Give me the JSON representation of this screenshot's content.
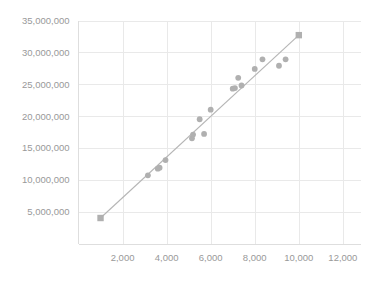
{
  "chart_data": {
    "type": "scatter",
    "title": "",
    "subtitle": "",
    "xlabel": "",
    "ylabel": "",
    "xlim": [
      0,
      12800
    ],
    "ylim": [
      0,
      35000000
    ],
    "grid": true,
    "legend": false,
    "legend_position": "none",
    "colors": {
      "marker": "#b0b0b0",
      "trendline": "#b5b5b5",
      "gridline": "#e9e9e9",
      "axis": "#dedede",
      "tick_label": "#999999",
      "background": "#ffffff"
    },
    "x_ticks": [
      2000,
      4000,
      6000,
      8000,
      10000,
      12000
    ],
    "x_tick_labels": [
      "2,000",
      "4,000",
      "6,000",
      "8,000",
      "10,000",
      "12,000"
    ],
    "y_ticks": [
      5000000,
      10000000,
      15000000,
      20000000,
      25000000,
      30000000,
      35000000
    ],
    "y_tick_labels": [
      "5,000,000",
      "10,000,000",
      "15,000,000",
      "20,000,000",
      "25,000,000",
      "30,000,000",
      "35,000,000"
    ],
    "series": [
      {
        "name": "data",
        "marker": "mixed",
        "points": [
          {
            "x": 1000,
            "y": 4000000,
            "shape": "square"
          },
          {
            "x": 3150,
            "y": 10700000,
            "shape": "circle"
          },
          {
            "x": 3600,
            "y": 11750000,
            "shape": "circle"
          },
          {
            "x": 3680,
            "y": 11900000,
            "shape": "circle"
          },
          {
            "x": 3950,
            "y": 13100000,
            "shape": "circle"
          },
          {
            "x": 5150,
            "y": 16500000,
            "shape": "circle"
          },
          {
            "x": 5200,
            "y": 17100000,
            "shape": "circle"
          },
          {
            "x": 5500,
            "y": 19500000,
            "shape": "circle"
          },
          {
            "x": 5700,
            "y": 17200000,
            "shape": "circle"
          },
          {
            "x": 6000,
            "y": 21000000,
            "shape": "circle"
          },
          {
            "x": 7000,
            "y": 24300000,
            "shape": "circle"
          },
          {
            "x": 7100,
            "y": 24400000,
            "shape": "circle"
          },
          {
            "x": 7250,
            "y": 26000000,
            "shape": "circle"
          },
          {
            "x": 7400,
            "y": 24800000,
            "shape": "circle"
          },
          {
            "x": 8000,
            "y": 27400000,
            "shape": "circle"
          },
          {
            "x": 8350,
            "y": 28900000,
            "shape": "circle"
          },
          {
            "x": 9100,
            "y": 27900000,
            "shape": "circle"
          },
          {
            "x": 9400,
            "y": 28900000,
            "shape": "circle"
          },
          {
            "x": 10000,
            "y": 32700000,
            "shape": "square"
          }
        ]
      }
    ],
    "trendline": {
      "visible": true,
      "x_start": 1000,
      "y_start": 4000000,
      "x_end": 10000,
      "y_end": 32700000
    }
  }
}
